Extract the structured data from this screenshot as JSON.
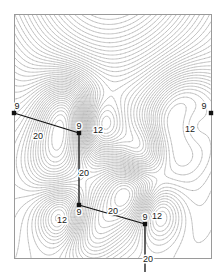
{
  "figure": {
    "kind": "contour-map",
    "frame": {
      "x": 14,
      "y": 14,
      "width": 197,
      "height": 244
    },
    "background": "#ffffff",
    "border_color": "#9a9a9a",
    "contour_color": "#8d8d8d",
    "marker_color": "#111111",
    "path_color": "#111111"
  },
  "chart_data": {
    "type": "heatmap",
    "title": "",
    "subtitle": "",
    "xlabel": "",
    "ylabel": "",
    "grid": false,
    "legend": "none",
    "xlim": [
      0,
      1
    ],
    "ylim": [
      0,
      1
    ],
    "contour_style": {
      "line_color": "#8d8d8d",
      "line_width": 0.35,
      "levels_approx": 46,
      "shading": "unfilled-dense-lines"
    },
    "maxima": [
      {
        "x": 0.27,
        "y": 0.4,
        "strength": "high"
      },
      {
        "x": 0.21,
        "y": 0.6,
        "strength": "medium"
      },
      {
        "x": 0.6,
        "y": 0.72,
        "strength": "high"
      },
      {
        "x": 0.38,
        "y": 0.88,
        "strength": "medium"
      },
      {
        "x": 0.88,
        "y": 0.43,
        "strength": "high"
      }
    ],
    "minima": [
      {
        "x": 0.43,
        "y": 0.46,
        "label": "12"
      },
      {
        "x": 0.9,
        "y": 0.45,
        "label": "12"
      },
      {
        "x": 0.25,
        "y": 0.83,
        "label": "12"
      },
      {
        "x": 0.72,
        "y": 0.81,
        "label": "12"
      },
      {
        "x": 0.64,
        "y": 0.58,
        "label": ""
      }
    ],
    "nodes": [
      {
        "id": "n1",
        "label": "9",
        "px": 14,
        "py": 113,
        "label_dx": 3,
        "label_dy": -4
      },
      {
        "id": "n2",
        "label": "9",
        "px": 79,
        "py": 133,
        "label_dx": 0,
        "label_dy": -4
      },
      {
        "id": "n3",
        "label": "9",
        "px": 79,
        "py": 205,
        "label_dx": 0,
        "label_dy": 10
      },
      {
        "id": "n4",
        "label": "9",
        "px": 145,
        "py": 224,
        "label_dx": 0,
        "label_dy": -4
      },
      {
        "id": "n5",
        "label": "9",
        "px": 211,
        "py": 113,
        "label_dx": -7,
        "label_dy": -4
      }
    ],
    "edges": [
      {
        "from": "n1",
        "to": "n2",
        "label": "20",
        "label_px": 38,
        "label_py": 139
      },
      {
        "from": "n2",
        "to": "n3",
        "label": "20",
        "label_px": 84,
        "label_py": 176
      },
      {
        "from": "n3",
        "to": "n4",
        "label": "20",
        "label_px": 113,
        "label_py": 214
      },
      {
        "from": "n4",
        "to": "stub-bottom",
        "label": "20",
        "label_px": 148,
        "label_py": 262
      }
    ],
    "stubs": [
      {
        "id": "stub-bottom",
        "from": "n4",
        "px": 145,
        "py": 272
      }
    ],
    "region_labels": [
      {
        "text": "12",
        "px": 98,
        "py": 133
      },
      {
        "text": "12",
        "px": 190,
        "py": 132
      },
      {
        "text": "12",
        "px": 62,
        "py": 223
      },
      {
        "text": "12",
        "px": 157,
        "py": 219
      }
    ]
  }
}
